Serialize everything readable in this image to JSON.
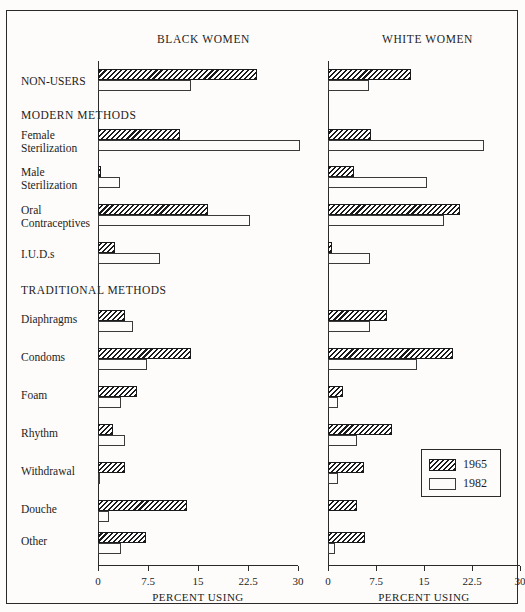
{
  "panels": [
    {
      "key": "black",
      "title": "BLACK WOMEN",
      "axis_title": "PERCENT USING"
    },
    {
      "key": "white",
      "title": "WHITE WOMEN",
      "axis_title": "PERCENT USING"
    }
  ],
  "axis": {
    "ticks": [
      "0",
      "7.5",
      "15",
      "22.5",
      "30"
    ],
    "min": 0,
    "max": 30
  },
  "group_headings": [
    {
      "label": "MODERN METHODS"
    },
    {
      "label": "TRADITIONAL METHODS"
    }
  ],
  "row_labels": [
    {
      "lines": [
        "NON-USERS"
      ]
    },
    {
      "lines": [
        "Female",
        "Sterilization"
      ]
    },
    {
      "lines": [
        "Male",
        "Sterilization"
      ]
    },
    {
      "lines": [
        "Oral",
        "Contraceptives"
      ]
    },
    {
      "lines": [
        "I.U.D.s"
      ]
    },
    {
      "lines": [
        "Diaphragms"
      ]
    },
    {
      "lines": [
        "Condoms"
      ]
    },
    {
      "lines": [
        "Foam"
      ]
    },
    {
      "lines": [
        "Rhythm"
      ]
    },
    {
      "lines": [
        "Withdrawal"
      ]
    },
    {
      "lines": [
        "Douche"
      ]
    },
    {
      "lines": [
        "Other"
      ]
    }
  ],
  "legend": {
    "items": [
      {
        "label": "1965",
        "style": "hatched"
      },
      {
        "label": "1982",
        "style": "plain"
      }
    ]
  },
  "chart_data": {
    "type": "bar",
    "title": "",
    "xlabel": "PERCENT USING",
    "ylabel": "",
    "xlim": [
      0,
      30
    ],
    "xticks": [
      0,
      7.5,
      15,
      22.5,
      30
    ],
    "grid": false,
    "legend_position": "bottom-right",
    "orientation": "horizontal",
    "panels": [
      {
        "name": "BLACK WOMEN",
        "categories": [
          "NON-USERS",
          "Female Sterilization",
          "Male Sterilization",
          "Oral Contraceptives",
          "I.U.D.s",
          "Diaphragms",
          "Condoms",
          "Foam",
          "Rhythm",
          "Withdrawal",
          "Douche",
          "Other"
        ],
        "series": [
          {
            "name": "1965",
            "values": [
              23.8,
              12.3,
              0.5,
              16.5,
              2.5,
              4.0,
              14.0,
              5.8,
              2.3,
              4.0,
              13.3,
              7.2
            ]
          },
          {
            "name": "1982",
            "values": [
              14.0,
              30.3,
              3.3,
              22.8,
              9.3,
              5.3,
              7.3,
              3.5,
              4.0,
              0.3,
              1.7,
              3.5
            ]
          }
        ]
      },
      {
        "name": "WHITE WOMEN",
        "categories": [
          "NON-USERS",
          "Female Sterilization",
          "Male Sterilization",
          "Oral Contraceptives",
          "I.U.D.s",
          "Diaphragms",
          "Condoms",
          "Foam",
          "Rhythm",
          "Withdrawal",
          "Douche",
          "Other"
        ],
        "series": [
          {
            "name": "1965",
            "values": [
              13.0,
              6.7,
              4.1,
              20.6,
              0.6,
              9.2,
              19.5,
              2.3,
              10.0,
              5.6,
              4.5,
              5.8
            ]
          },
          {
            "name": "1982",
            "values": [
              6.4,
              24.4,
              15.5,
              18.1,
              6.6,
              6.6,
              13.9,
              1.6,
              4.5,
              1.6,
              0.0,
              1.1
            ]
          }
        ]
      }
    ]
  },
  "layout": {
    "row_tops": [
      58,
      118,
      155,
      193,
      231,
      299,
      337,
      375,
      413,
      451,
      489,
      521
    ],
    "label_tops": [
      64,
      118,
      155,
      193,
      237,
      302,
      340,
      378,
      416,
      454,
      492,
      524
    ],
    "heading_tops": [
      98,
      273
    ],
    "heading_after_row": [
      0,
      4
    ]
  }
}
